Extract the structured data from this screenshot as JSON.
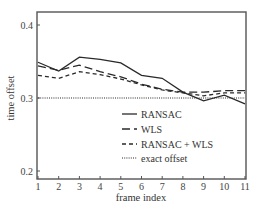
{
  "chart_data": {
    "type": "line",
    "title": "",
    "xlabel": "frame index",
    "ylabel": "time offset",
    "x": [
      1,
      2,
      3,
      4,
      5,
      6,
      7,
      8,
      9,
      10,
      11
    ],
    "xlim": [
      1,
      11
    ],
    "ylim": [
      0.19,
      0.42
    ],
    "xticks": [
      "1",
      "2",
      "3",
      "4",
      "5",
      "6",
      "7",
      "8",
      "9",
      "10",
      "11"
    ],
    "yticks": [
      {
        "value": 0.2,
        "label": "0.2"
      },
      {
        "value": 0.3,
        "label": "0.3"
      },
      {
        "value": 0.4,
        "label": "0.4"
      }
    ],
    "grid": false,
    "legend_position": "lower right (inside)",
    "series": [
      {
        "name": "RANSAC",
        "style": "solid",
        "values": [
          0.349,
          0.337,
          0.356,
          0.353,
          0.348,
          0.331,
          0.327,
          0.308,
          0.296,
          0.304,
          0.292
        ]
      },
      {
        "name": "WLS",
        "style": "long-dash",
        "values": [
          0.344,
          0.338,
          0.345,
          0.336,
          0.329,
          0.319,
          0.312,
          0.308,
          0.308,
          0.31,
          0.31
        ]
      },
      {
        "name": "RANSAC + WLS",
        "style": "short-dash",
        "values": [
          0.331,
          0.327,
          0.336,
          0.332,
          0.326,
          0.318,
          0.311,
          0.307,
          0.303,
          0.307,
          0.307
        ]
      },
      {
        "name": "exact offset",
        "style": "dotted",
        "values": [
          0.3,
          0.3,
          0.3,
          0.3,
          0.3,
          0.3,
          0.3,
          0.3,
          0.3,
          0.3,
          0.3
        ]
      }
    ]
  },
  "colors": {
    "line": "#2a2a2a",
    "axis": "#555555",
    "text": "#333333"
  }
}
